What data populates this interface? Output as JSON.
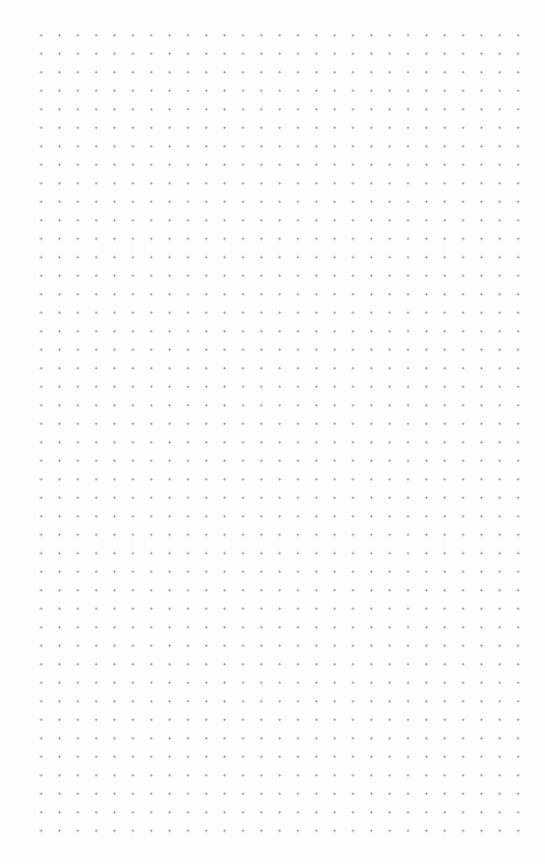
{
  "canvas": {
    "type": "dot-grid",
    "background_color": "#ffffff",
    "dot_color": "#9a9a9a",
    "columns": 27,
    "rows": 44,
    "spacing_x": 18.35,
    "spacing_y": 18.5
  }
}
